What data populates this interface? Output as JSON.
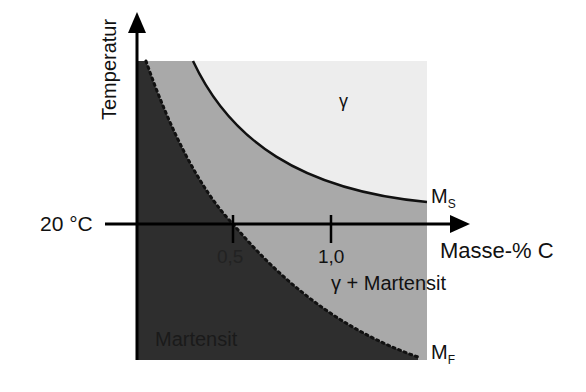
{
  "diagram": {
    "title": "",
    "colors": {
      "gamma_region": "#ededed",
      "gamma_martensite_region": "#a9a9a9",
      "martensite_region": "#2e2e2e",
      "lines": "#111111"
    },
    "axes": {
      "y_label": "Temperatur",
      "x_label": "Masse-% C",
      "reference_temp_label": "20 °C",
      "x_ticks": [
        "0,5",
        "1,0"
      ]
    },
    "curves": {
      "ms": {
        "label_main": "M",
        "label_sub": "S",
        "style": "solid"
      },
      "mf": {
        "label_main": "M",
        "label_sub": "F",
        "style": "dotted"
      }
    },
    "regions": {
      "gamma": "γ",
      "gamma_martensite": "γ + Martensit",
      "martensite": "Martensit"
    }
  }
}
